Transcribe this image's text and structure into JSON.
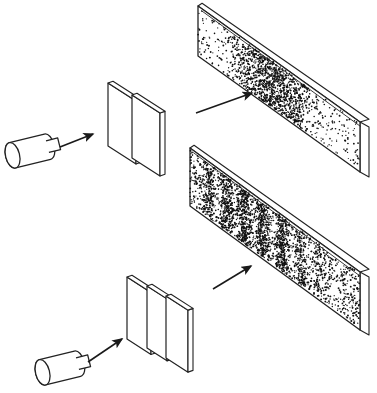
{
  "figure": {
    "background_color": "#ffffff",
    "ink_color": "#1a1a1a",
    "plate_face_color": "#ffffff",
    "plate_edge_color": "#222222",
    "dot_color": "#111111",
    "width": 377,
    "height": 393
  },
  "experiments": [
    {
      "id": "single-slit",
      "label": "Single slit experiment",
      "source": {
        "name": "electron-gun",
        "label": "Electron gun",
        "body": {
          "x": 12,
          "y": 138,
          "length": 36,
          "radius_y": 13,
          "radius_x": 7,
          "angle_deg": -14
        },
        "nozzle": {
          "length": 12,
          "radius_y": 6
        }
      },
      "beam_arrow": {
        "x1": 60,
        "y1": 147,
        "x2": 93,
        "y2": 134,
        "label": "beam direction"
      },
      "barrier": {
        "name": "single-slit-barrier",
        "label": "Barrier with one slit",
        "slit_count": 1,
        "plate_count": 2,
        "plates": [
          {
            "x": 108,
            "y": 83,
            "w": 28,
            "h": 63,
            "depth": 5,
            "skew": 18
          },
          {
            "x": 132,
            "y": 95,
            "w": 28,
            "h": 63,
            "depth": 5,
            "skew": 18
          }
        ]
      },
      "result_arrow": {
        "x1": 196,
        "y1": 113,
        "x2": 252,
        "y2": 93,
        "label": "to detection screen"
      },
      "screen": {
        "name": "detection-screen-single",
        "label": "Detection screen",
        "pattern_type": "single broad diffraction band",
        "band_count": 1,
        "quad": {
          "tlx": 198,
          "tly": 6,
          "trx": 360,
          "try": 122,
          "brx": 360,
          "bry": 172,
          "blx": 198,
          "bly": 56
        },
        "thickness": 9,
        "bands": [
          {
            "center": 0.47,
            "width": 0.3,
            "density": 1.0
          }
        ],
        "background_density": 0.1,
        "dot_count": 1400
      }
    },
    {
      "id": "double-slit",
      "label": "Double slit experiment",
      "source": {
        "name": "electron-gun",
        "label": "Electron gun",
        "body": {
          "x": 42,
          "y": 355,
          "length": 36,
          "radius_y": 13,
          "radius_x": 7,
          "angle_deg": -14
        },
        "nozzle": {
          "length": 12,
          "radius_y": 6
        }
      },
      "beam_arrow": {
        "x1": 88,
        "y1": 362,
        "x2": 122,
        "y2": 339,
        "label": "beam direction"
      },
      "barrier": {
        "name": "double-slit-barrier",
        "label": "Barrier with two slits",
        "slit_count": 2,
        "plate_count": 3,
        "plates": [
          {
            "x": 127,
            "y": 277,
            "w": 24,
            "h": 62,
            "depth": 5,
            "skew": 18
          },
          {
            "x": 147,
            "y": 286,
            "w": 20,
            "h": 62,
            "depth": 5,
            "skew": 18
          },
          {
            "x": 166,
            "y": 296,
            "w": 22,
            "h": 62,
            "depth": 5,
            "skew": 18
          }
        ]
      },
      "result_arrow": {
        "x1": 213,
        "y1": 289,
        "x2": 251,
        "y2": 266,
        "label": "to detection screen"
      },
      "screen": {
        "name": "detection-screen-double",
        "label": "Detection screen",
        "pattern_type": "multiple interference fringes",
        "band_count": 7,
        "quad": {
          "tlx": 190,
          "tly": 148,
          "trx": 360,
          "try": 272,
          "brx": 360,
          "bry": 330,
          "blx": 190,
          "bly": 206
        },
        "thickness": 9,
        "bands": [
          {
            "center": 0.115,
            "width": 0.055,
            "density": 0.72
          },
          {
            "center": 0.215,
            "width": 0.055,
            "density": 0.88
          },
          {
            "center": 0.32,
            "width": 0.058,
            "density": 1.0
          },
          {
            "center": 0.43,
            "width": 0.058,
            "density": 1.0
          },
          {
            "center": 0.54,
            "width": 0.055,
            "density": 0.92
          },
          {
            "center": 0.65,
            "width": 0.052,
            "density": 0.78
          },
          {
            "center": 0.76,
            "width": 0.05,
            "density": 0.55
          }
        ],
        "background_density": 0.22,
        "dot_count": 2600
      }
    }
  ]
}
